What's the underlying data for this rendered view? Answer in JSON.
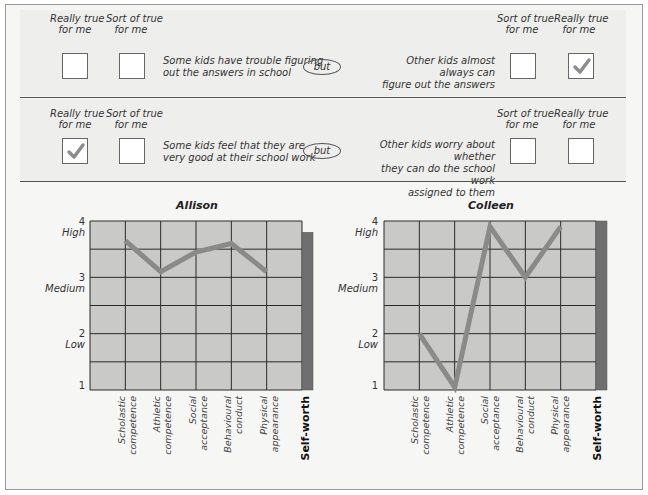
{
  "questions": [
    {
      "left_labels": {
        "really": "Really true for me",
        "sort": "Sort of true for me"
      },
      "left_statement": [
        "Some kids have trouble figuring",
        "out the answers in school"
      ],
      "connector": "but",
      "right_statement": [
        "Other kids almost always can",
        "figure out the answers"
      ],
      "right_labels": {
        "sort": "Sort of true for me",
        "really": "Really true for me"
      },
      "checked": "right-really"
    },
    {
      "left_labels": {
        "really": "Really true for me",
        "sort": "Sort of true for me"
      },
      "left_statement": [
        "Some kids feel that they are",
        "very good at their school work"
      ],
      "connector": "but",
      "right_statement": [
        "Other kids worry about whether",
        "they can do the school work",
        "assigned to them"
      ],
      "right_labels": {
        "sort": "Sort of true for me",
        "really": "Really true for me"
      },
      "checked": "left-really"
    }
  ],
  "label_lines": {
    "really_1": "Really true",
    "sort_1": "Sort of  true",
    "line_2": "for me"
  },
  "colors": {
    "plot_bg": "#c9c9c7",
    "grid": "#2a2a2a",
    "line": "#8a8a8a",
    "selfworth_bar": "#6f6f6f",
    "check": "#8c8c8c"
  },
  "y_axis_labels": [
    {
      "value": "4",
      "name": "High"
    },
    {
      "value": "3",
      "name": "Medium"
    },
    {
      "value": "2",
      "name": "Low"
    },
    {
      "value": "1",
      "name": ""
    }
  ],
  "chart_data": [
    {
      "type": "line",
      "title": "Allison",
      "categories": [
        "Scholastic competence",
        "Athletic competence",
        "Social acceptance",
        "Behavioural conduct",
        "Physical appearance",
        "Self-worth"
      ],
      "series": [
        {
          "name": "Domain scores",
          "values": [
            3.65,
            3.1,
            3.45,
            3.6,
            3.1
          ]
        }
      ],
      "self_worth_bar": 3.8,
      "ylim": [
        1,
        4
      ],
      "yticks": [
        1,
        2,
        3,
        4
      ],
      "ytick_labels": [
        "1",
        "2 Low",
        "3 Medium",
        "4 High"
      ],
      "grid": true,
      "xlabel": "",
      "ylabel": ""
    },
    {
      "type": "line",
      "title": "Colleen",
      "categories": [
        "Scholastic competence",
        "Athletic competence",
        "Social acceptance",
        "Behavioural conduct",
        "Physical appearance",
        "Self-worth"
      ],
      "series": [
        {
          "name": "Domain scores",
          "values": [
            2.0,
            1.05,
            3.9,
            3.0,
            3.9
          ]
        }
      ],
      "self_worth_bar": 4.0,
      "ylim": [
        1,
        4
      ],
      "yticks": [
        1,
        2,
        3,
        4
      ],
      "ytick_labels": [
        "1",
        "2 Low",
        "3 Medium",
        "4 High"
      ],
      "grid": true,
      "xlabel": "",
      "ylabel": ""
    }
  ],
  "x_labels": [
    [
      "Scholastic",
      "competence"
    ],
    [
      "Athletic",
      "competence"
    ],
    [
      "Social",
      "acceptance"
    ],
    [
      "Behavioural",
      "conduct"
    ],
    [
      "Physical",
      "appearance"
    ],
    [
      "Self-worth"
    ]
  ]
}
